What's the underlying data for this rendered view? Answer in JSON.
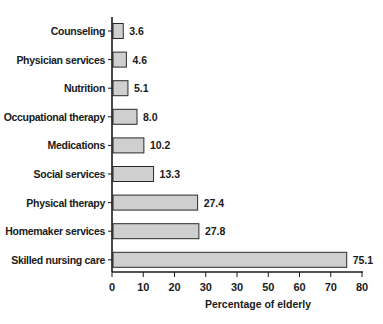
{
  "chart_data": {
    "type": "bar",
    "orientation": "horizontal",
    "title": "",
    "categories": [
      "Counseling",
      "Physician services",
      "Nutrition",
      "Occupational therapy",
      "Medications",
      "Social services",
      "Physical therapy",
      "Homemaker services",
      "Skilled nursing care"
    ],
    "values": [
      3.6,
      4.6,
      5.1,
      8.0,
      10.2,
      13.3,
      27.4,
      27.8,
      75.1
    ],
    "value_labels": [
      "3.6",
      "4.6",
      "5.1",
      "8.0",
      "10.2",
      "13.3",
      "27.4",
      "27.8",
      "75.1"
    ],
    "xlabel": "Percentage of elderly",
    "ylabel": "",
    "xlim": [
      0,
      80
    ],
    "x_ticks": [
      0,
      10,
      20,
      30,
      40,
      50,
      60,
      70,
      80
    ],
    "x_tick_labels": [
      "0",
      "10",
      "20",
      "30",
      "30",
      "50",
      "60",
      "70",
      "80"
    ],
    "grid": false,
    "legend": "none",
    "bar_color": "#cfcfcf",
    "bar_edge_color": "#2a2a2a"
  }
}
